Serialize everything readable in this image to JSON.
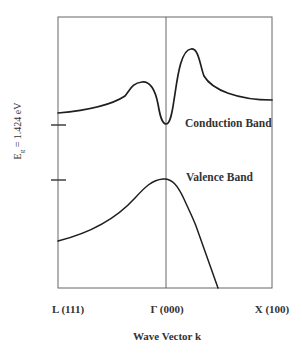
{
  "figure": {
    "type": "band-structure-diagram",
    "energy_gap_label": {
      "prefix": "E",
      "subscript": "g",
      "value": " = 1.424 eV"
    },
    "bands": {
      "conduction": "Conduction Band",
      "valence": "Valence Band"
    },
    "x_axis": {
      "title": "Wave Vector k",
      "ticks": [
        {
          "label": "L (111)"
        },
        {
          "label": "Γ (000)"
        },
        {
          "label": "X (100)"
        }
      ]
    },
    "colors": {
      "frame": "#555555",
      "curve": "#1f1f1f",
      "text": "#333333"
    }
  }
}
